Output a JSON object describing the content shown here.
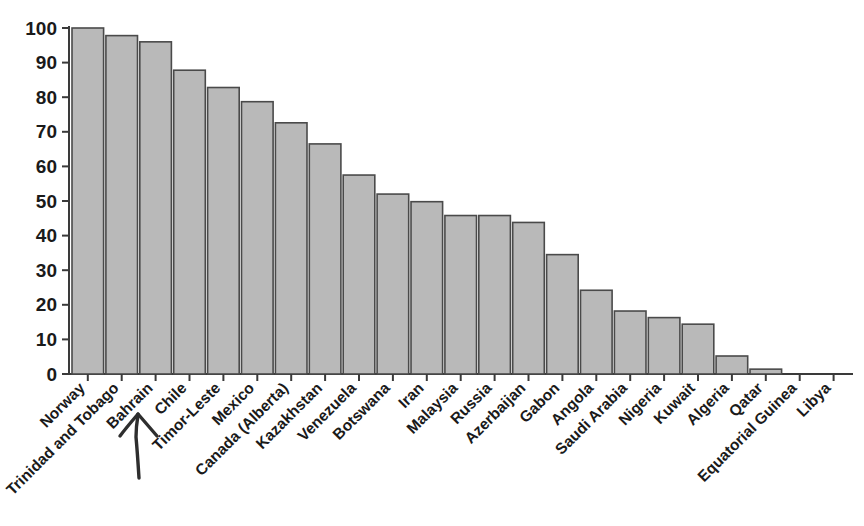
{
  "chart_data": {
    "type": "bar",
    "title": "",
    "subtitle": "",
    "xlabel": "",
    "ylabel": "",
    "ylim": [
      0,
      100
    ],
    "grid": false,
    "legend": "none",
    "y_ticks": [
      "0",
      "10",
      "20",
      "30",
      "40",
      "50",
      "60",
      "70",
      "80",
      "90",
      "100"
    ],
    "categories": [
      "Norway",
      "Trinidad and Tobago",
      "Bahrain",
      "Chile",
      "Timor-Leste",
      "Mexico",
      "Canada (Alberta)",
      "Kazakhstan",
      "Venezuela",
      "Botswana",
      "Iran",
      "Malaysia",
      "Russia",
      "Azerbaijan",
      "Gabon",
      "Angola",
      "Saudi Arabia",
      "Nigeria",
      "Kuwait",
      "Algeria",
      "Qatar",
      "Equatorial Guinea",
      "Libya"
    ],
    "values": [
      100,
      97.8,
      96,
      87.8,
      82.8,
      78.7,
      72.6,
      66.5,
      57.5,
      52,
      49.8,
      45.8,
      45.8,
      43.8,
      34.5,
      24.2,
      18.2,
      16.3,
      14.4,
      5.2,
      1.4,
      0,
      0
    ]
  },
  "annotation": {
    "arrow_name": "hand-drawn-arrow",
    "points_to": "Bahrain"
  },
  "style": {
    "bar_fill": "#b9b9b9",
    "bar_stroke": "#4a4a4a",
    "axis_color": "#3a3a3a",
    "text_color": "#1a1a1a",
    "background": "#ffffff"
  }
}
